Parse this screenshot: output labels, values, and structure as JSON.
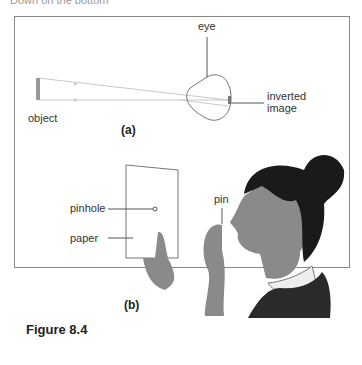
{
  "page": {
    "cut_off_heading": "Down on the bottom"
  },
  "figure": {
    "caption": "Figure 8.4",
    "part_a": {
      "label": "(a)",
      "labels": {
        "eye": "eye",
        "object": "object",
        "inverted_image": [
          "inverted",
          "image"
        ]
      }
    },
    "part_b": {
      "label": "(b)",
      "labels": {
        "pinhole": "pinhole",
        "paper": "paper",
        "pin": "pin"
      }
    }
  }
}
